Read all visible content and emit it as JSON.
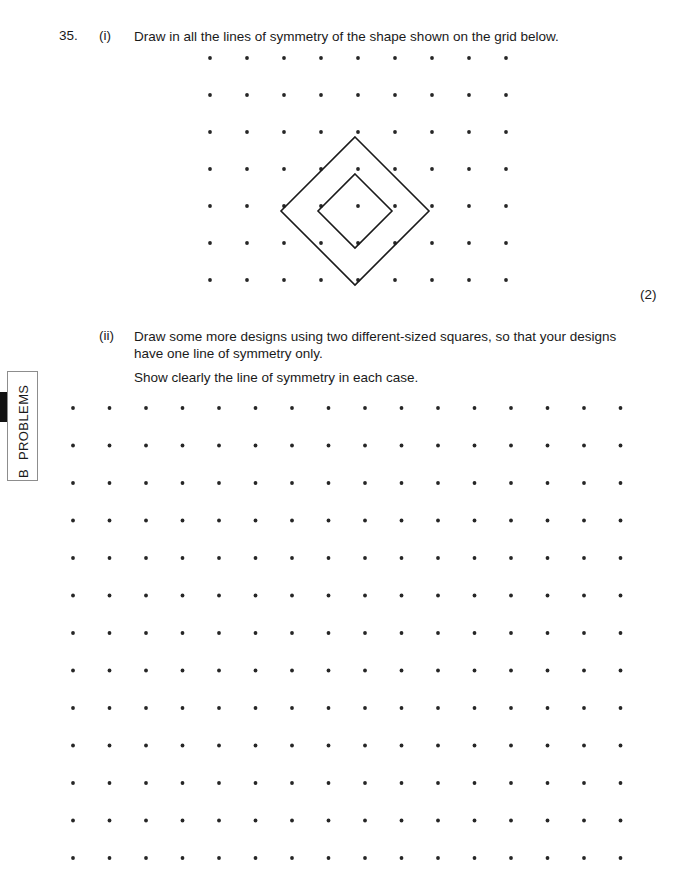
{
  "side_tab": {
    "letter": "B",
    "section": "PROBLEMS"
  },
  "question": {
    "number": "35.",
    "part_i_label": "(i)",
    "part_i_text": "Draw in all the lines of symmetry of the shape shown on the grid below.",
    "part_i_marks": "(2)",
    "part_ii_label": "(ii)",
    "part_ii_text": "Draw some more designs using two different-sized squares, so that your designs have one line of symmetry only.",
    "part_ii_subtext": "Show clearly the line of symmetry in each case."
  },
  "grid_top": {
    "columns": 9,
    "rows": 7,
    "spacing_x": 37,
    "spacing_y": 37,
    "origin_x": 20,
    "origin_y": 8,
    "dot_radius": 1.9,
    "dot_color": "#262626"
  },
  "grid_bottom": {
    "columns": 16,
    "rows": 13,
    "spacing_x": 36.5,
    "spacing_y": 37.5,
    "origin_x": 18,
    "origin_y": 13,
    "dot_radius": 1.9,
    "dot_color": "#262626"
  },
  "shape": {
    "name": "two-concentric-diamonds",
    "center_x": 165,
    "center_y": 161,
    "outer_half_diagonal": 74,
    "inner_half_diagonal": 37,
    "stroke_color": "#1a1a1a",
    "stroke_width": 1.6
  }
}
